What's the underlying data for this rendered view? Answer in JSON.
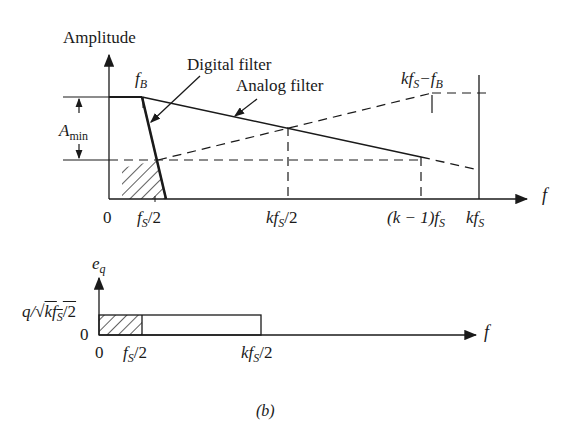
{
  "figure": {
    "caption": "(b)",
    "top_plot": {
      "y_axis_label": "Amplitude",
      "x_axis_label": "f",
      "annotations": {
        "digital_filter": "Digital filter",
        "analog_filter": "Analog filter",
        "f_B": "f_B",
        "A_min": "A_min",
        "kfs_minus_fB": "kf_S−f_B"
      },
      "x_ticks": [
        "0",
        "f_S/2",
        "kf_S/2",
        "(k−1)f_S",
        "kf_S"
      ]
    },
    "bottom_plot": {
      "y_axis_label": "e_q",
      "x_axis_label": "f",
      "y_ticks": [
        "0",
        "q/√(kf_S/2)"
      ],
      "x_ticks": [
        "0",
        "f_S/2",
        "kf_S/2"
      ]
    }
  },
  "labels": {
    "amplitude": "Amplitude",
    "digital": "Digital filter",
    "analog": "Analog filter",
    "fB_f": "f",
    "fB_sub": "B",
    "amin_a": "A",
    "amin_sub": "min",
    "kfsfb_k": "kf",
    "kfsfb_s": "S",
    "kfsfb_rest": "−f",
    "kfsfb_b": "B",
    "f": "f",
    "zero": "0",
    "fs2_f": "f",
    "fs2_s": "S",
    "fs2_rest": "/2",
    "kfs2_k": "kf",
    "kfs2_s": "S",
    "kfs2_rest": "/2",
    "km1_a": "(k − 1)f",
    "km1_s": "S",
    "kfs_k": "kf",
    "kfs_s": "S",
    "eq_e": "e",
    "eq_q": "q",
    "qlabel_q": "q/√",
    "qlabel_k": "kf",
    "qlabel_s": "S",
    "qlabel_rest": "/2",
    "caption": "(b)"
  }
}
